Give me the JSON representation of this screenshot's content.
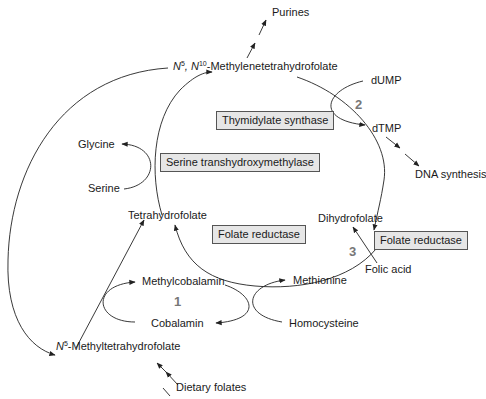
{
  "diagram": {
    "nodes": {
      "purines": "Purines",
      "methylene_thf_prefix": "N",
      "methylene_thf_sup1": "5",
      "methylene_thf_mid": ", N",
      "methylene_thf_sup2": "10",
      "methylene_thf_suffix": "-Methylenetetrahydrofolate",
      "dump": "dUMP",
      "dtmp": "dTMP",
      "dna_synthesis": "DNA synthesis",
      "glycine": "Glycine",
      "serine": "Serine",
      "tetrahydrofolate": "Tetrahydrofolate",
      "dihydrofolate": "Dihydrofolate",
      "folic_acid": "Folic acid",
      "methylcobalamin": "Methylcobalamin",
      "cobalamin": "Cobalamin",
      "methionine": "Methionine",
      "homocysteine": "Homocysteine",
      "methyl_thf_prefix": "N",
      "methyl_thf_sup": "5",
      "methyl_thf_suffix": "-Methyltetrahydrofolate",
      "dietary_folates": "Dietary folates"
    },
    "enzymes": {
      "thymidylate_synthase": "Thymidylate synthase",
      "serine_transhydroxymethylase": "Serine transhydroxymethylase",
      "folate_reductase_inner": "Folate reductase",
      "folate_reductase_outer": "Folate reductase"
    },
    "step_numbers": {
      "step1": "1",
      "step2": "2",
      "step3": "3"
    },
    "colors": {
      "enzyme_box_fill": "#e6e6e6",
      "step_number": "#777777",
      "line": "#222222"
    }
  }
}
